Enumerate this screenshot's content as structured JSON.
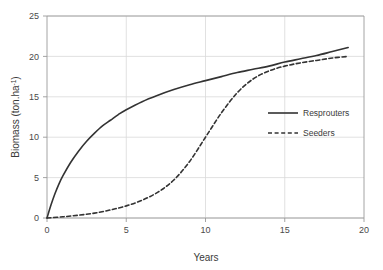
{
  "chart_data": {
    "type": "line",
    "title": "",
    "subtitle": "",
    "xlabel": "Years",
    "ylabel": "Biomass (ton.ha-1)",
    "ylabel_base": "Biomass (ton.ha",
    "ylabel_sup": "-1",
    "ylabel_tail": ")",
    "xlim": [
      0,
      20
    ],
    "ylim": [
      0,
      25
    ],
    "grid": true,
    "legend_position": "center-right",
    "xticks": [
      0,
      5,
      10,
      15,
      20
    ],
    "xtick_labels": [
      "0",
      "5",
      "10",
      "15",
      "20"
    ],
    "yticks": [
      0,
      5,
      10,
      15,
      20,
      25
    ],
    "ytick_labels": [
      "0",
      "5",
      "10",
      "15",
      "20",
      "25"
    ],
    "series": [
      {
        "name": "Resprouters",
        "style": "solid",
        "color": "#333333",
        "x": [
          0,
          0.25,
          0.5,
          0.75,
          1,
          1.5,
          2,
          2.5,
          3,
          3.5,
          4,
          4.5,
          5,
          6,
          7,
          8,
          9,
          10,
          11,
          12,
          13,
          14,
          15,
          16,
          17,
          18,
          19
        ],
        "values": [
          0,
          1.6,
          3.0,
          4.2,
          5.2,
          6.9,
          8.3,
          9.5,
          10.5,
          11.4,
          12.1,
          12.8,
          13.4,
          14.4,
          15.2,
          15.9,
          16.5,
          17.0,
          17.5,
          18.0,
          18.4,
          18.8,
          19.3,
          19.7,
          20.1,
          20.6,
          21.1
        ]
      },
      {
        "name": "Seeders",
        "style": "dashed",
        "color": "#333333",
        "x": [
          0,
          1,
          2,
          3,
          4,
          5,
          6,
          7,
          8,
          9,
          10,
          11,
          12,
          13,
          14,
          15,
          16,
          17,
          18,
          19
        ],
        "values": [
          0,
          0.15,
          0.35,
          0.6,
          1.0,
          1.5,
          2.2,
          3.2,
          4.7,
          7.0,
          10.0,
          13.0,
          15.5,
          17.2,
          18.2,
          18.8,
          19.2,
          19.5,
          19.8,
          20.0
        ]
      }
    ],
    "legend_entries": [
      {
        "label": "Resprouters",
        "style": "solid"
      },
      {
        "label": "Seeders",
        "style": "dashed"
      }
    ]
  },
  "axis": {
    "x_title": "Years",
    "y_title": "Biomass (ton.ha-1)"
  },
  "legend": {
    "resprouters_label": "Resprouters",
    "seeders_label": "Seeders"
  },
  "colors": {
    "line": "#333333",
    "grid": "#d9d9d9",
    "axis": "#9a9a9a",
    "text": "#3a3a3a",
    "background": "#ffffff"
  }
}
